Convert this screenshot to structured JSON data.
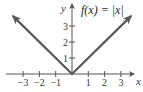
{
  "chart_data": {
    "type": "line",
    "title": "f(x) = |x|",
    "xlabel": "x",
    "ylabel": "y",
    "xlim": [
      -3.6,
      3.6
    ],
    "ylim": [
      0,
      4
    ],
    "x_ticks": [
      -3,
      -2,
      -1,
      1,
      2,
      3
    ],
    "x_tick_labels": [
      "−3",
      "−2",
      "−1",
      "1",
      "2",
      "3"
    ],
    "y_ticks": [
      1,
      2,
      3
    ],
    "y_tick_labels": [
      "1",
      "2",
      "3"
    ],
    "grid": false,
    "series": [
      {
        "name": "f(x) = |x|",
        "x": [
          -3.6,
          0,
          3.6
        ],
        "y": [
          3.6,
          0,
          3.6
        ],
        "arrows": true
      }
    ],
    "colors": {
      "curve": "#5a5a5a",
      "axis": "#555555"
    }
  }
}
